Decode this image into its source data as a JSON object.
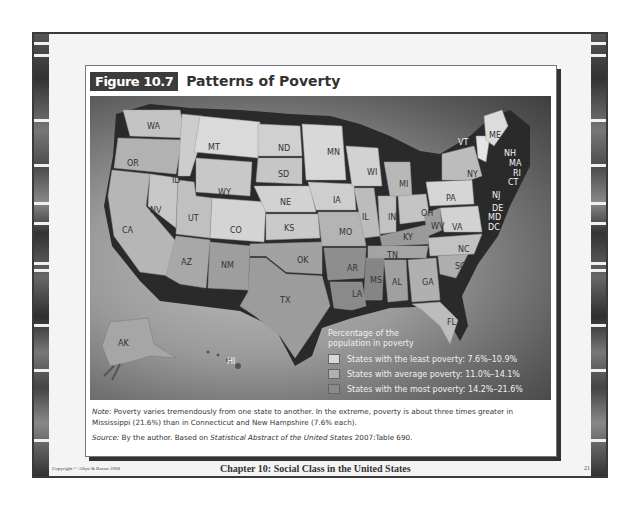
{
  "figure": {
    "number": "Figure 10.7",
    "title": "Patterns of Poverty"
  },
  "map": {
    "states": [
      {
        "abbr": "WA",
        "x": 57,
        "y": 26
      },
      {
        "abbr": "OR",
        "x": 37,
        "y": 63
      },
      {
        "abbr": "CA",
        "x": 32,
        "y": 130
      },
      {
        "abbr": "NV",
        "x": 60,
        "y": 110
      },
      {
        "abbr": "ID",
        "x": 82,
        "y": 80
      },
      {
        "abbr": "MT",
        "x": 118,
        "y": 47
      },
      {
        "abbr": "WY",
        "x": 128,
        "y": 92
      },
      {
        "abbr": "UT",
        "x": 98,
        "y": 118
      },
      {
        "abbr": "CO",
        "x": 140,
        "y": 130
      },
      {
        "abbr": "AZ",
        "x": 91,
        "y": 162
      },
      {
        "abbr": "NM",
        "x": 131,
        "y": 165
      },
      {
        "abbr": "ND",
        "x": 188,
        "y": 48
      },
      {
        "abbr": "SD",
        "x": 188,
        "y": 74
      },
      {
        "abbr": "NE",
        "x": 190,
        "y": 102
      },
      {
        "abbr": "KS",
        "x": 194,
        "y": 128
      },
      {
        "abbr": "OK",
        "x": 207,
        "y": 160
      },
      {
        "abbr": "TX",
        "x": 190,
        "y": 200
      },
      {
        "abbr": "MN",
        "x": 237,
        "y": 52
      },
      {
        "abbr": "IA",
        "x": 243,
        "y": 100
      },
      {
        "abbr": "MO",
        "x": 249,
        "y": 132
      },
      {
        "abbr": "AR",
        "x": 257,
        "y": 168
      },
      {
        "abbr": "LA",
        "x": 262,
        "y": 194
      },
      {
        "abbr": "WI",
        "x": 277,
        "y": 72
      },
      {
        "abbr": "IL",
        "x": 272,
        "y": 117
      },
      {
        "abbr": "MS",
        "x": 280,
        "y": 180
      },
      {
        "abbr": "MI",
        "x": 309,
        "y": 84
      },
      {
        "abbr": "IN",
        "x": 298,
        "y": 117
      },
      {
        "abbr": "KY",
        "x": 313,
        "y": 137
      },
      {
        "abbr": "TN",
        "x": 297,
        "y": 155
      },
      {
        "abbr": "AL",
        "x": 302,
        "y": 182
      },
      {
        "abbr": "GA",
        "x": 332,
        "y": 182
      },
      {
        "abbr": "FL",
        "x": 357,
        "y": 222
      },
      {
        "abbr": "OH",
        "x": 331,
        "y": 113
      },
      {
        "abbr": "WV",
        "x": 341,
        "y": 126
      },
      {
        "abbr": "VA",
        "x": 362,
        "y": 127
      },
      {
        "abbr": "NC",
        "x": 368,
        "y": 149
      },
      {
        "abbr": "SC",
        "x": 365,
        "y": 166
      },
      {
        "abbr": "PA",
        "x": 356,
        "y": 98
      },
      {
        "abbr": "NY",
        "x": 377,
        "y": 74
      },
      {
        "abbr": "VT",
        "x": 368,
        "y": 42,
        "light": true
      },
      {
        "abbr": "ME",
        "x": 399,
        "y": 35
      },
      {
        "abbr": "NH",
        "x": 414,
        "y": 53,
        "light": true
      },
      {
        "abbr": "MA",
        "x": 419,
        "y": 63,
        "light": true
      },
      {
        "abbr": "RI",
        "x": 423,
        "y": 73,
        "light": true
      },
      {
        "abbr": "CT",
        "x": 418,
        "y": 82,
        "light": true
      },
      {
        "abbr": "NJ",
        "x": 402,
        "y": 95,
        "light": true
      },
      {
        "abbr": "DE",
        "x": 402,
        "y": 108,
        "light": true
      },
      {
        "abbr": "MD",
        "x": 398,
        "y": 117,
        "light": true
      },
      {
        "abbr": "DC",
        "x": 398,
        "y": 127,
        "light": true
      },
      {
        "abbr": "AK",
        "x": 28,
        "y": 243
      },
      {
        "abbr": "HI",
        "x": 137,
        "y": 261,
        "light": true
      }
    ],
    "legend": {
      "title_line1": "Percentage of the",
      "title_line2": "population in poverty",
      "items": [
        {
          "label": "States with the least poverty: 7.6%–10.9%",
          "color": "#d8d8d8"
        },
        {
          "label": "States with average poverty: 11.0%–14.1%",
          "color": "#b0b0b0"
        },
        {
          "label": "States with the most poverty: 14.2%–21.6%",
          "color": "#8a8a8a"
        }
      ]
    }
  },
  "notes": {
    "note_label": "Note:",
    "note_text": " Poverty varies tremendously from one state to another. In the extreme, poverty is about three times greater in Mississippi (21.6%) than in Connecticut and New Hampshire (7.6% each).",
    "source_label": "Source:",
    "source_text_a": " By the author. Based on ",
    "source_italic": "Statistical Abstract of the United States",
    "source_text_b": " 2007:Table 690."
  },
  "footer": {
    "copyright": "Copyright © Allyn & Bacon 2008",
    "chapter": "Chapter 10: Social Class in the United States",
    "page": "21"
  }
}
